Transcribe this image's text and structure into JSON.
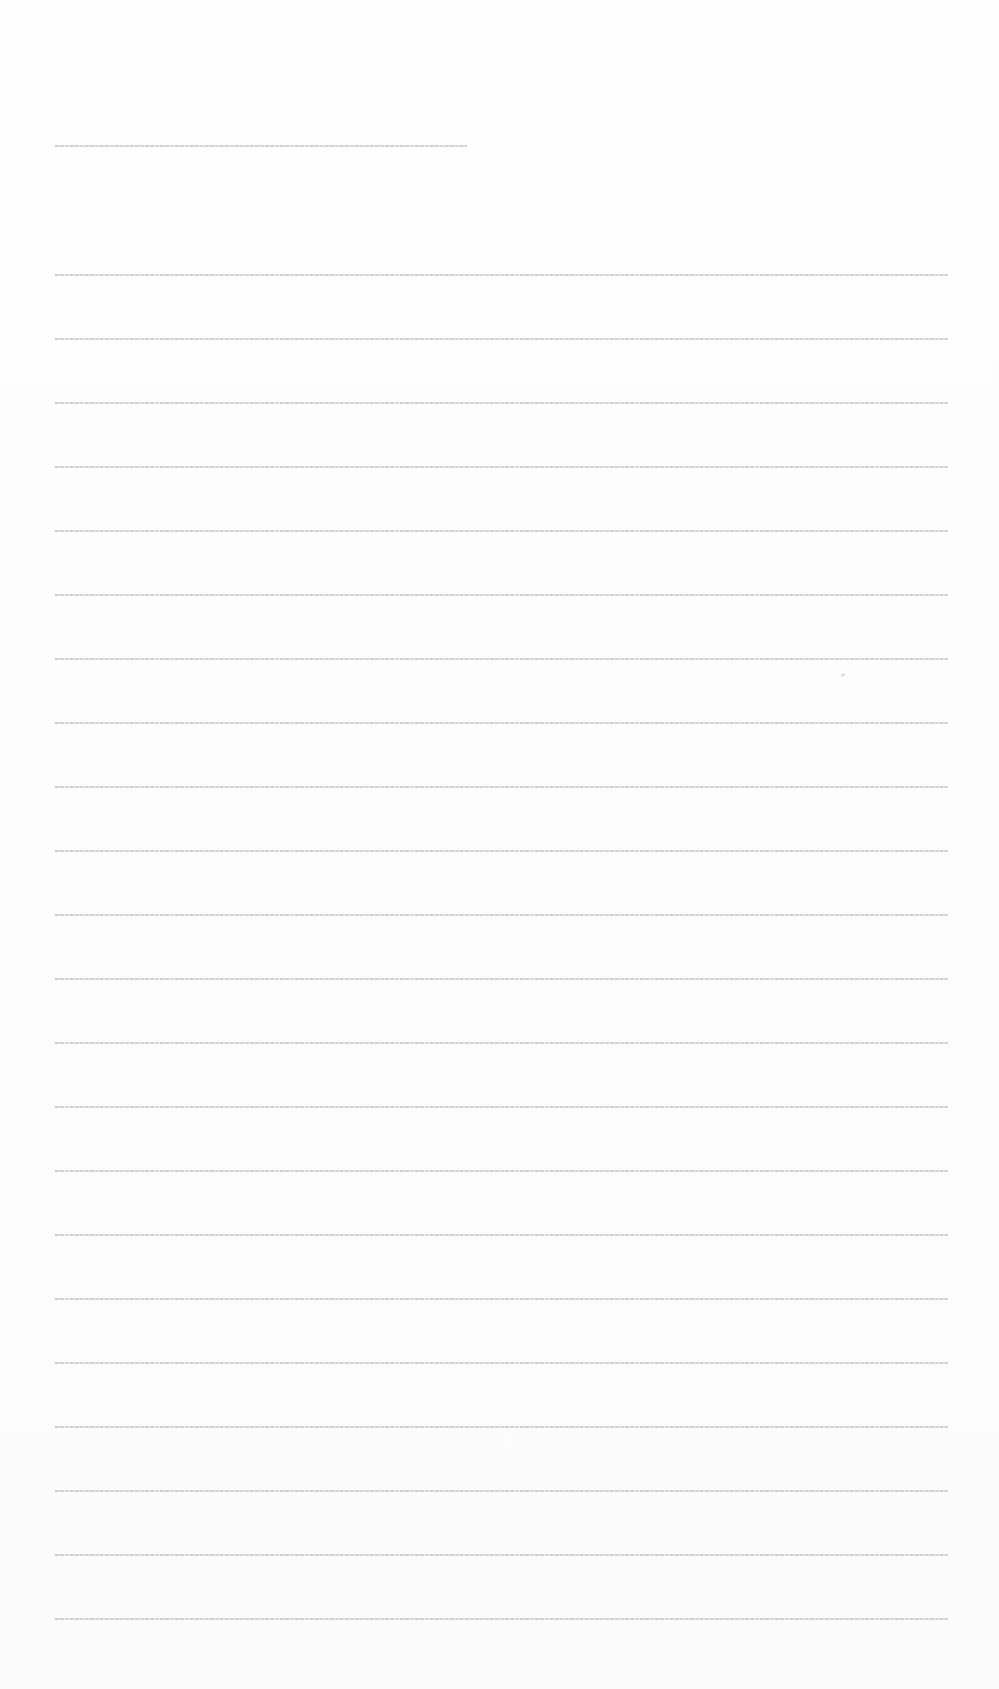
{
  "document": {
    "type": "scanned-page",
    "legible_text": false,
    "lines": [
      {
        "y": 145,
        "x_start": 55,
        "x_end": 467
      },
      {
        "y": 274,
        "x_start": 55,
        "x_end": 948
      },
      {
        "y": 338,
        "x_start": 55,
        "x_end": 948
      },
      {
        "y": 402,
        "x_start": 55,
        "x_end": 948
      },
      {
        "y": 466,
        "x_start": 55,
        "x_end": 948
      },
      {
        "y": 530,
        "x_start": 55,
        "x_end": 948
      },
      {
        "y": 594,
        "x_start": 55,
        "x_end": 948
      },
      {
        "y": 658,
        "x_start": 55,
        "x_end": 948
      },
      {
        "y": 722,
        "x_start": 55,
        "x_end": 948
      },
      {
        "y": 786,
        "x_start": 55,
        "x_end": 948
      },
      {
        "y": 850,
        "x_start": 55,
        "x_end": 948
      },
      {
        "y": 914,
        "x_start": 55,
        "x_end": 948
      },
      {
        "y": 978,
        "x_start": 55,
        "x_end": 948
      },
      {
        "y": 1042,
        "x_start": 55,
        "x_end": 948
      },
      {
        "y": 1106,
        "x_start": 55,
        "x_end": 948
      },
      {
        "y": 1170,
        "x_start": 55,
        "x_end": 948
      },
      {
        "y": 1234,
        "x_start": 55,
        "x_end": 948
      },
      {
        "y": 1298,
        "x_start": 55,
        "x_end": 948
      },
      {
        "y": 1362,
        "x_start": 55,
        "x_end": 948
      },
      {
        "y": 1426,
        "x_start": 55,
        "x_end": 948
      },
      {
        "y": 1490,
        "x_start": 55,
        "x_end": 948
      },
      {
        "y": 1554,
        "x_start": 55,
        "x_end": 948
      },
      {
        "y": 1618,
        "x_start": 55,
        "x_end": 948
      }
    ],
    "marks": [
      {
        "x": 841,
        "y": 674
      }
    ]
  }
}
